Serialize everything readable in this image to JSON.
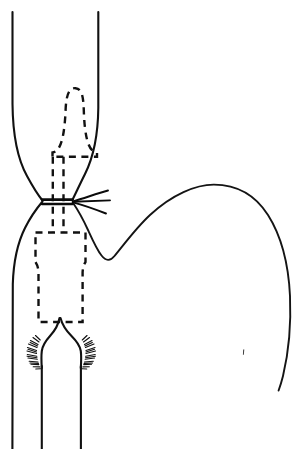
{
  "figure": {
    "title": "Esophageal stricture with balloon dilator at the gastro-esophageal junction",
    "caption": "",
    "background_color": "#ffffff",
    "ink_color": "#111111",
    "width": 307,
    "height": 449,
    "style": "black-and-white medical line drawing"
  },
  "labels": {
    "esophagus": "esophagus",
    "stricture": "stricture",
    "dilator": "balloon dilator",
    "fundus": "gastric fundus",
    "hiatus": "diaphragmatic hiatus",
    "crura": "diaphragmatic crura"
  },
  "parts": [
    {
      "id": "esophagus-left-wall",
      "name": "esophagus-left-wall",
      "kind": "solid-outline",
      "description": "left solid wall of esophagus running from top edge, narrowing at the stricture, then widening and descending to the bottom edge"
    },
    {
      "id": "esophagus-right-wall",
      "name": "esophagus-right-wall",
      "kind": "solid-outline",
      "description": "right solid wall of esophagus from top edge narrowing to the stricture waist"
    },
    {
      "id": "dilator-balloon",
      "name": "dilator-balloon-outline",
      "kind": "dashed-outline",
      "description": "dashed bulb-shaped balloon dilator seated above the stricture"
    },
    {
      "id": "dilator-shaft",
      "name": "dilator-shaft",
      "kind": "dashed-lines",
      "description": "two parallel dashed shaft lines passing through the stricture"
    },
    {
      "id": "dilator-lower-body",
      "name": "dilator-lower-body-outline",
      "kind": "dashed-outline",
      "description": "dashed rectangular lower body of the device below the stricture"
    },
    {
      "id": "stricture-waist",
      "name": "stricture-waist-marker",
      "kind": "solid-mark",
      "description": "short horizontal marks at the narrowest point of the esophagus"
    },
    {
      "id": "pointer-fan",
      "name": "stricture-pointer-fan",
      "kind": "leader-lines",
      "description": "three radiating leader lines converging on the stricture waist"
    },
    {
      "id": "gastric-fundus",
      "name": "gastric-fundus-outline",
      "kind": "solid-outline",
      "description": "large dome-shaped curve of the gastric fundus to the right"
    },
    {
      "id": "hiatus-peak",
      "name": "diaphragmatic-hiatus-peak",
      "kind": "solid-outline",
      "description": "pointed arch of the diaphragmatic hiatus at the lower esophagus"
    },
    {
      "id": "crura-hatching-left",
      "name": "crura-hatching-left",
      "kind": "stipple-hatching",
      "description": "stippled hatching marks on the left diaphragmatic crus"
    },
    {
      "id": "crura-hatching-right",
      "name": "crura-hatching-right",
      "kind": "stipple-hatching",
      "description": "stippled hatching marks on the right diaphragmatic crus"
    },
    {
      "id": "lower-vertical-lines",
      "name": "lower-esophagus-vertical-lines",
      "kind": "solid-lines",
      "description": "three vertical lines descending to the bottom edge of the figure"
    },
    {
      "id": "ink-speck",
      "name": "ink-speck-artifact",
      "kind": "artifact",
      "description": "small stray ink speck in the right field"
    }
  ]
}
